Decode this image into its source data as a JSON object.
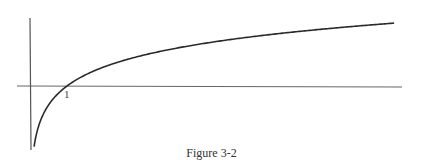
{
  "chart_data": {
    "type": "line",
    "title": "",
    "caption": "Figure 3-2",
    "function": "y = ln(x)",
    "xlabel": "",
    "ylabel": "",
    "tick_labels": [
      "1"
    ],
    "xlim": [
      -0.35,
      9.9
    ],
    "ylim": [
      -2.3,
      2.45
    ],
    "grid": false,
    "series": [
      {
        "name": "ln(x)",
        "x": [
          0.11,
          0.2,
          0.3,
          0.5,
          0.75,
          1,
          1.5,
          2,
          3,
          4,
          5,
          6,
          7,
          8,
          9,
          9.84
        ],
        "values": [
          -2.2,
          -1.61,
          -1.2,
          -0.69,
          -0.29,
          0,
          0.41,
          0.69,
          1.1,
          1.39,
          1.61,
          1.79,
          1.95,
          2.08,
          2.2,
          2.29
        ]
      }
    ],
    "colors": {
      "curve": "#2a2a2a",
      "axis": "#555555"
    }
  },
  "figure": {
    "caption": "Figure 3-2",
    "tick_one": "1"
  }
}
